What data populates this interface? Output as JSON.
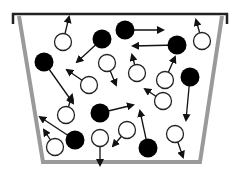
{
  "diagram": {
    "type": "particle-container",
    "colors": {
      "background": "#ffffff",
      "rim": "#222222",
      "wall": "#9a9a9a",
      "filled_particle": "#000000",
      "open_particle_fill": "#ffffff",
      "open_particle_stroke": "#222222",
      "arrow": "#111111"
    },
    "container": {
      "rim": {
        "x1": 13,
        "x2": 227,
        "y": 14,
        "tick_bottom": 24
      },
      "left_wall": {
        "top": [
          19,
          16
        ],
        "bottom": [
          43,
          162
        ]
      },
      "right_wall": {
        "top": [
          222,
          16
        ],
        "bottom": [
          200,
          162
        ]
      },
      "bottom_y": 162
    },
    "particle_radius": 9,
    "filled_particles": [
      {
        "cx": 44,
        "cy": 62,
        "to": [
          73,
          103
        ]
      },
      {
        "cx": 102,
        "cy": 39,
        "to": [
          77,
          62
        ]
      },
      {
        "cx": 125,
        "cy": 30,
        "to": [
          163,
          30
        ]
      },
      {
        "cx": 177,
        "cy": 45,
        "to": [
          133,
          46
        ]
      },
      {
        "cx": 190,
        "cy": 77,
        "to": [
          186,
          120
        ]
      },
      {
        "cx": 100,
        "cy": 113,
        "to": [
          133,
          105
        ]
      },
      {
        "cx": 75,
        "cy": 140,
        "to": [
          40,
          117
        ]
      },
      {
        "cx": 148,
        "cy": 148,
        "to": [
          140,
          111
        ]
      }
    ],
    "open_particles": [
      {
        "cx": 63,
        "cy": 42,
        "to": [
          69,
          17
        ]
      },
      {
        "cx": 89,
        "cy": 85,
        "to": [
          67,
          70
        ]
      },
      {
        "cx": 107,
        "cy": 63,
        "to": [
          116,
          85
        ]
      },
      {
        "cx": 137,
        "cy": 73,
        "to": [
          132,
          55
        ]
      },
      {
        "cx": 165,
        "cy": 80,
        "to": [
          175,
          57
        ]
      },
      {
        "cx": 202,
        "cy": 41,
        "to": [
          196,
          20
        ]
      },
      {
        "cx": 66,
        "cy": 115,
        "to": [
          72,
          95
        ]
      },
      {
        "cx": 163,
        "cy": 101,
        "to": [
          145,
          89
        ]
      },
      {
        "cx": 55,
        "cy": 147,
        "to": [
          44,
          130
        ]
      },
      {
        "cx": 100,
        "cy": 138,
        "to": [
          100,
          165
        ]
      },
      {
        "cx": 127,
        "cy": 130,
        "to": [
          113,
          146
        ]
      },
      {
        "cx": 175,
        "cy": 134,
        "to": [
          183,
          157
        ]
      }
    ]
  }
}
